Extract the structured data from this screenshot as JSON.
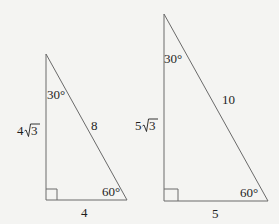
{
  "diagram": {
    "triangles": [
      {
        "name": "small",
        "vertices": {
          "top": [
            46,
            54
          ],
          "right_angle": [
            46,
            200
          ],
          "bottom_right": [
            127,
            200
          ]
        },
        "angles": {
          "top": "30°",
          "bottom_right": "60°",
          "right_angle_marker": true
        },
        "sides": {
          "vertical_leg": {
            "coef": "4",
            "radical": "3"
          },
          "hypotenuse": "8",
          "base": "4"
        }
      },
      {
        "name": "large",
        "vertices": {
          "top": [
            164,
            14
          ],
          "right_angle": [
            164,
            201
          ],
          "bottom_right": [
            268,
            201
          ]
        },
        "angles": {
          "top": "30°",
          "bottom_right": "60°",
          "right_angle_marker": true
        },
        "sides": {
          "vertical_leg": {
            "coef": "5",
            "radical": "3"
          },
          "hypotenuse": "10",
          "base": "5"
        }
      }
    ],
    "colors": {
      "background": "#f4f4f2",
      "stroke": "#6a6a6a",
      "text": "#1e1e1e"
    }
  }
}
